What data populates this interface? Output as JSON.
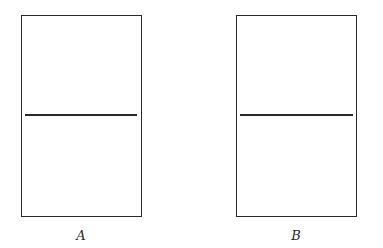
{
  "diagram": {
    "panels": [
      {
        "id": "A",
        "label": "A",
        "has_horizontal_divider": true,
        "divider_position": "middle"
      },
      {
        "id": "B",
        "label": "B",
        "has_horizontal_divider": true,
        "divider_position": "middle"
      }
    ],
    "colors": {
      "stroke": "#2a2a2a",
      "background": "#ffffff"
    }
  }
}
